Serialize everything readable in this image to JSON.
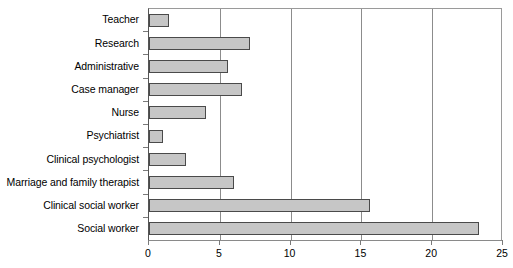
{
  "chart_data": {
    "type": "bar",
    "orientation": "horizontal",
    "title": "",
    "subtitle": "",
    "xlabel": "",
    "ylabel": "",
    "categories": [
      "Teacher",
      "Research",
      "Administrative",
      "Case manager",
      "Nurse",
      "Psychiatrist",
      "Clinical psychologist",
      "Marriage and family therapist",
      "Clinical social worker",
      "Social worker"
    ],
    "values": [
      1.4,
      7.1,
      5.6,
      6.6,
      4.0,
      1.0,
      2.6,
      6.0,
      15.6,
      23.3
    ],
    "xlim": [
      0,
      25
    ],
    "xticks": [
      0,
      5,
      10,
      15,
      20,
      25
    ],
    "xtick_labels": [
      "0",
      "5",
      "10",
      "15",
      "20",
      "25"
    ],
    "grid": "vertical",
    "legend": "none",
    "bar_fill_color": "#c6c6c6",
    "bar_edge_color": "#4a4a4a",
    "gridline_color": "#8c8c8c",
    "axis_color": "#8a8a8a",
    "background_color": "#ffffff"
  }
}
